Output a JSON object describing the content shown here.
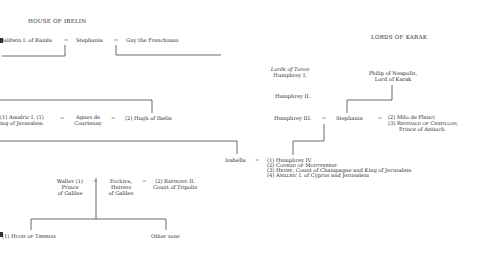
{
  "headings": {
    "house_of_ibelin": "HOUSE OF IBELIN",
    "lords_of_karak": "LORDS OF KARAK",
    "lords_of_toron": "Lords of Toron"
  },
  "marriage_symbol": "=",
  "row1": {
    "baldwin": "Baldwin I. of Ramla",
    "stephania": "Stephania",
    "guy": "Guy the Frenchman"
  },
  "toron": {
    "humphrey1": "Humphrey I.",
    "humphrey2": "Humphrey II.",
    "humphrey3": "Humphrey III."
  },
  "karak": {
    "philip_line1": "Philip of Neapolis,",
    "philip_line2": "Lord of Karak",
    "stephania": "Stephania",
    "spouse2": "(2) Milo de Planci",
    "spouse3": "(3) Reginald of Chatillon,",
    "spouse3_title": "Prince of Antioch"
  },
  "row2": {
    "amalric_line1": "(1) Amalric I. (1)",
    "amalric_line2": "King of Jerusalem",
    "agnes_line1": "Agnes de",
    "agnes_line2": "Courtenay",
    "hugh": "(2) Hugh of Ibelin"
  },
  "isabella": {
    "name": "Isabella",
    "spouses": [
      "(1) Humphrey IV.",
      "(2) Conrad of Montferrat",
      "(3) Henry, Count of Champagne and King of Jerusalem",
      "(4) Amalric I. of Cyprus and Jerusalem"
    ]
  },
  "galilee": {
    "walter_line1": "Walter (1)",
    "walter_line2": "Prince",
    "walter_line3": "of Galilee",
    "eschiva_line1": "Eschiva,",
    "eschiva_line2": "Heiress",
    "eschiva_line3": "of Galilee",
    "raymond_line1": "(2) Raymond II.",
    "raymond_line2": "Count of Tripolis"
  },
  "children": {
    "hugh_tiberias": "(1) Hugh of Tiberias",
    "other_sons": "Other sons"
  }
}
